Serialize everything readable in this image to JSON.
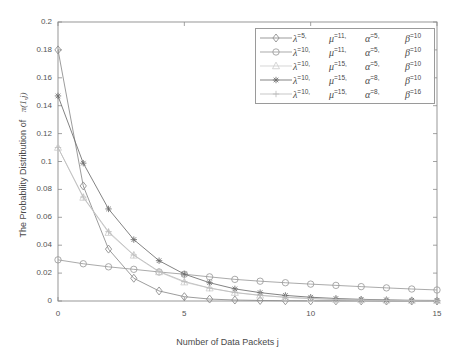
{
  "chart_data": {
    "type": "line",
    "title": "",
    "xlabel": "Number of Data Packets j",
    "ylabel": "The Probability Distribution of π(1,j)",
    "ylabel_plain": "The Probability Distribution of",
    "ylabel_symbol": "π(1,j)",
    "xlim": [
      0,
      15
    ],
    "ylim": [
      0,
      0.2
    ],
    "xticks": [
      0,
      5,
      10,
      15
    ],
    "xtick_labels": [
      "0",
      "5",
      "10",
      "15"
    ],
    "yticks": [
      0,
      0.02,
      0.04,
      0.06,
      0.08,
      0.1,
      0.12,
      0.14,
      0.16,
      0.18,
      0.2
    ],
    "ytick_labels": [
      "0",
      "0.02",
      "0.04",
      "0.06",
      "0.08",
      "0.1",
      "0.12",
      "0.14",
      "0.16",
      "0.18",
      "0.2"
    ],
    "grid": false,
    "legend_position": "upper right",
    "x": [
      0,
      1,
      2,
      3,
      4,
      5,
      6,
      7,
      8,
      9,
      10,
      11,
      12,
      13,
      14,
      15
    ],
    "series": [
      {
        "name": "λ=5, μ=11, α=5, β=10",
        "marker": "diamond",
        "color": "#8a8a8a",
        "values": [
          0.18,
          0.0825,
          0.0372,
          0.0163,
          0.0072,
          0.0031,
          0.0014,
          0.0007,
          0.0004,
          0.0002,
          0.0001,
          0.0001,
          0.0001,
          0.0,
          0.0,
          0.0
        ]
      },
      {
        "name": "λ=10, μ=11, α=5, β=10",
        "marker": "circle",
        "color": "#9b9b9b",
        "values": [
          0.0295,
          0.0267,
          0.0245,
          0.0227,
          0.0208,
          0.0192,
          0.0173,
          0.0155,
          0.0142,
          0.0131,
          0.0121,
          0.0112,
          0.0103,
          0.0094,
          0.0086,
          0.0079
        ]
      },
      {
        "name": "λ=10, μ=15, α=5, β=10",
        "marker": "triangle",
        "color": "#cfcfcf",
        "values": [
          0.11,
          0.0742,
          0.049,
          0.0327,
          0.0208,
          0.0135,
          0.0092,
          0.006,
          0.004,
          0.0026,
          0.0017,
          0.0011,
          0.0008,
          0.0005,
          0.0003,
          0.0002
        ]
      },
      {
        "name": "λ=10, μ=15, α=8, β=10",
        "marker": "asterisk",
        "color": "#6d6d6d",
        "values": [
          0.147,
          0.0988,
          0.066,
          0.044,
          0.0289,
          0.0193,
          0.0131,
          0.0087,
          0.006,
          0.004,
          0.0027,
          0.0018,
          0.0012,
          0.0008,
          0.0005,
          0.0004
        ]
      },
      {
        "name": "λ=10, μ=15, α=8, β=16",
        "marker": "plus",
        "color": "#bdbdbd",
        "values": [
          0.11,
          0.0745,
          0.0497,
          0.033,
          0.0212,
          0.014,
          0.0093,
          0.0061,
          0.0041,
          0.0027,
          0.0018,
          0.0012,
          0.0008,
          0.0005,
          0.0003,
          0.0002
        ]
      }
    ]
  },
  "legend": {
    "rows": [
      {
        "marker": "diamond",
        "lambda": "5,",
        "mu": "11,",
        "alpha": "5,",
        "beta": "10"
      },
      {
        "marker": "circle",
        "lambda": "10,",
        "mu": "11,",
        "alpha": "5,",
        "beta": "10"
      },
      {
        "marker": "triangle",
        "lambda": "10,",
        "mu": "15,",
        "alpha": "5,",
        "beta": "10"
      },
      {
        "marker": "asterisk",
        "lambda": "10,",
        "mu": "15,",
        "alpha": "8,",
        "beta": "10"
      },
      {
        "marker": "plus",
        "lambda": "10,",
        "mu": "15,",
        "alpha": "8,",
        "beta": "16"
      }
    ],
    "lambda_glyph": "λ",
    "mu_glyph": "μ",
    "alpha_glyph": "α",
    "beta_glyph": "β",
    "equals": "="
  },
  "axes": {
    "frame_color": "#8c8c8c",
    "background": "#ffffff"
  }
}
